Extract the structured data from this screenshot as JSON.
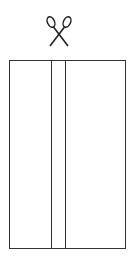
{
  "diagram": {
    "icon": "scissors-icon",
    "stroke_color": "#333333",
    "rectangle": {
      "x": 9,
      "y": 60,
      "width": 117,
      "height": 189
    },
    "dividers": [
      51,
      65
    ]
  }
}
